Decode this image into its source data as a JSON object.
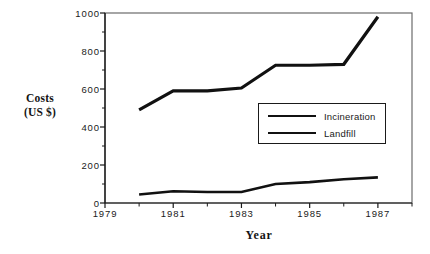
{
  "chart_data": {
    "type": "line",
    "title": "",
    "xlabel": "Year",
    "ylabel": "Costs (US $)",
    "ylabel_line1": "Costs",
    "ylabel_line2": "(US  $)",
    "x": [
      1979,
      1980,
      1981,
      1982,
      1983,
      1984,
      1985,
      1986,
      1987
    ],
    "categories": [
      "1979",
      "1980",
      "1981",
      "1982",
      "1983",
      "1984",
      "1985",
      "1986",
      "1987"
    ],
    "xlim": [
      1979,
      1988
    ],
    "ylim": [
      0,
      1000
    ],
    "xtick_labels": [
      "1979",
      "1981",
      "1983",
      "1985",
      "1987"
    ],
    "xtick_values": [
      1979,
      1981,
      1983,
      1985,
      1987
    ],
    "xtick_minor_values": [
      1980,
      1982,
      1984,
      1986,
      1988
    ],
    "ytick_labels": [
      "0",
      "200",
      "400",
      "600",
      "800",
      "1000"
    ],
    "ytick_values": [
      0,
      200,
      400,
      600,
      800,
      1000
    ],
    "ytick_minor_values": [
      100,
      300,
      500,
      700,
      900
    ],
    "grid": false,
    "legend_position": "center-right",
    "frame": true,
    "series": [
      {
        "name": "Incineration",
        "x": [
          1980,
          1981,
          1982,
          1983,
          1984,
          1985,
          1986,
          1987
        ],
        "values": [
          490,
          590,
          590,
          605,
          725,
          725,
          730,
          980
        ],
        "color": "#111111",
        "line_width": 3.2
      },
      {
        "name": "Landfill",
        "x": [
          1980,
          1981,
          1982,
          1983,
          1984,
          1985,
          1986,
          1987
        ],
        "values": [
          45,
          62,
          58,
          58,
          100,
          110,
          125,
          135
        ],
        "color": "#111111",
        "line_width": 2.6
      }
    ]
  },
  "axes": {
    "y_title_line1": "Costs",
    "y_title_line2": "(US  $)",
    "x_title": "Year"
  },
  "legend": {
    "entries": [
      {
        "label": "Incineration"
      },
      {
        "label": "Landfill"
      }
    ]
  },
  "colors": {
    "background": "#ffffff",
    "ink": "#1a1a1a",
    "line": "#111111",
    "frame": "#6b6b6b"
  }
}
